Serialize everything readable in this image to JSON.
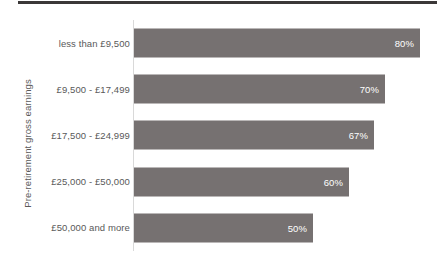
{
  "chart_data": {
    "type": "bar",
    "orientation": "horizontal",
    "title": "",
    "xlabel": "",
    "ylabel": "Pre-retirement gross earnings",
    "categories": [
      "less than £9,500",
      "£9,500 - £17,499",
      "£17,500 - £24,999",
      "£25,000 - £50,000",
      "£50,000 and more"
    ],
    "values": [
      80,
      70,
      67,
      60,
      50
    ],
    "value_labels": [
      "80%",
      "70%",
      "67%",
      "60%",
      "50%"
    ],
    "xlim": [
      0,
      83
    ],
    "grid": false,
    "legend": false,
    "bar_color": "#767171",
    "value_label_color": "#ffffff",
    "axis_line_color": "#d9d9d9",
    "text_color": "#595959",
    "rule_color": "#3b3838"
  },
  "axis": {
    "y_title": "Pre-retirement gross earnings"
  },
  "bars": [
    {
      "label": "less than £9,500",
      "value_label": "80%",
      "width_px": 286
    },
    {
      "label": "£9,500 - £17,499",
      "value_label": "70%",
      "width_px": 251
    },
    {
      "label": "£17,500 - £24,999",
      "value_label": "67%",
      "width_px": 240
    },
    {
      "label": "£25,000 - £50,000",
      "value_label": "60%",
      "width_px": 215
    },
    {
      "label": "£50,000 and more",
      "value_label": "50%",
      "width_px": 179
    }
  ]
}
